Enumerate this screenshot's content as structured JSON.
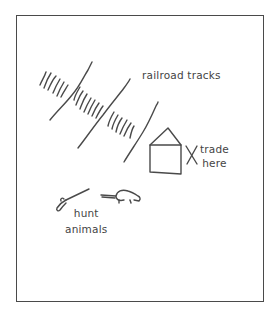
{
  "diagram": {
    "type": "hand-drawn map sketch",
    "stroke_color": "#4a4a4a",
    "text_color": "#444444",
    "labels": {
      "railroad": "railroad tracks",
      "trade_line1": "trade",
      "trade_line2": "here",
      "hunt_line1": "hunt",
      "hunt_line2": "animals"
    },
    "elements": [
      {
        "name": "railroad-tracks",
        "shape": "three diagonal rail lines with cross ties"
      },
      {
        "name": "trading-post",
        "shape": "house with triangular roof",
        "marker": "X"
      },
      {
        "name": "rifle",
        "shape": "rifle sketch"
      },
      {
        "name": "animal",
        "shape": "small four-legged animal (beaver/otter)"
      }
    ]
  }
}
